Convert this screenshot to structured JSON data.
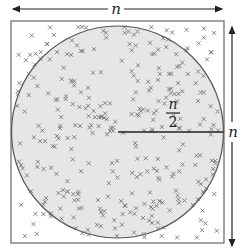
{
  "diagram": {
    "top_label": "n",
    "side_label": "n",
    "radius_label_numerator": "n",
    "radius_label_denominator": "2",
    "colors": {
      "square_stroke": "#666666",
      "circle_fill": "#e6e6e6",
      "circle_stroke": "#555555",
      "marks": "#777777",
      "arrows": "#222222"
    },
    "square": {
      "x": 11,
      "y": 21,
      "size": 213
    },
    "circle": {
      "cx": 117.5,
      "cy": 132,
      "r": 106
    }
  }
}
